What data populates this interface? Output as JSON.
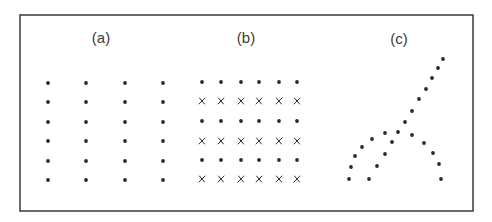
{
  "figure": {
    "frame": {
      "x": 20,
      "y": 15,
      "width": 453,
      "height": 196,
      "stroke": "#3a3a3a"
    },
    "ink_color": "#2a2a2a",
    "panels": [
      {
        "id": "a",
        "label": "(a)",
        "label_pos": [
          101,
          37
        ],
        "description": "Uniform grid of dots, 4 columns by 6 rows",
        "grid": {
          "columns_x": [
            48,
            86,
            125,
            163
          ],
          "rows_y": [
            83,
            102,
            122,
            141,
            161,
            180
          ],
          "row_markers": [
            "dot",
            "dot",
            "dot",
            "dot",
            "dot",
            "dot"
          ]
        }
      },
      {
        "id": "b",
        "label": "(b)",
        "label_pos": [
          246,
          37
        ],
        "description": "Grid of 6 columns by 6 rows, alternating rows of dots and x marks",
        "grid": {
          "columns_x": [
            202,
            221,
            241,
            259,
            279,
            297
          ],
          "rows_y": [
            82,
            101,
            121,
            141,
            160,
            179
          ],
          "row_markers": [
            "dot",
            "x",
            "dot",
            "x",
            "dot",
            "x"
          ]
        }
      },
      {
        "id": "c",
        "label": "(c)",
        "label_pos": [
          399,
          38
        ],
        "description": "Dots arranged along curved and straight crossing paths",
        "points": [
          [
            443,
            59
          ],
          [
            438,
            68
          ],
          [
            432,
            78
          ],
          [
            426,
            89
          ],
          [
            419,
            99
          ],
          [
            412,
            111
          ],
          [
            405,
            122
          ],
          [
            398,
            132
          ],
          [
            385,
            133
          ],
          [
            372,
            139
          ],
          [
            362,
            147
          ],
          [
            355,
            156
          ],
          [
            351,
            167
          ],
          [
            349,
            179
          ],
          [
            392,
            142
          ],
          [
            385,
            154
          ],
          [
            377,
            166
          ],
          [
            369,
            179
          ],
          [
            412,
            135
          ],
          [
            424,
            143
          ],
          [
            433,
            153
          ],
          [
            439,
            164
          ],
          [
            441,
            179
          ]
        ]
      }
    ]
  }
}
